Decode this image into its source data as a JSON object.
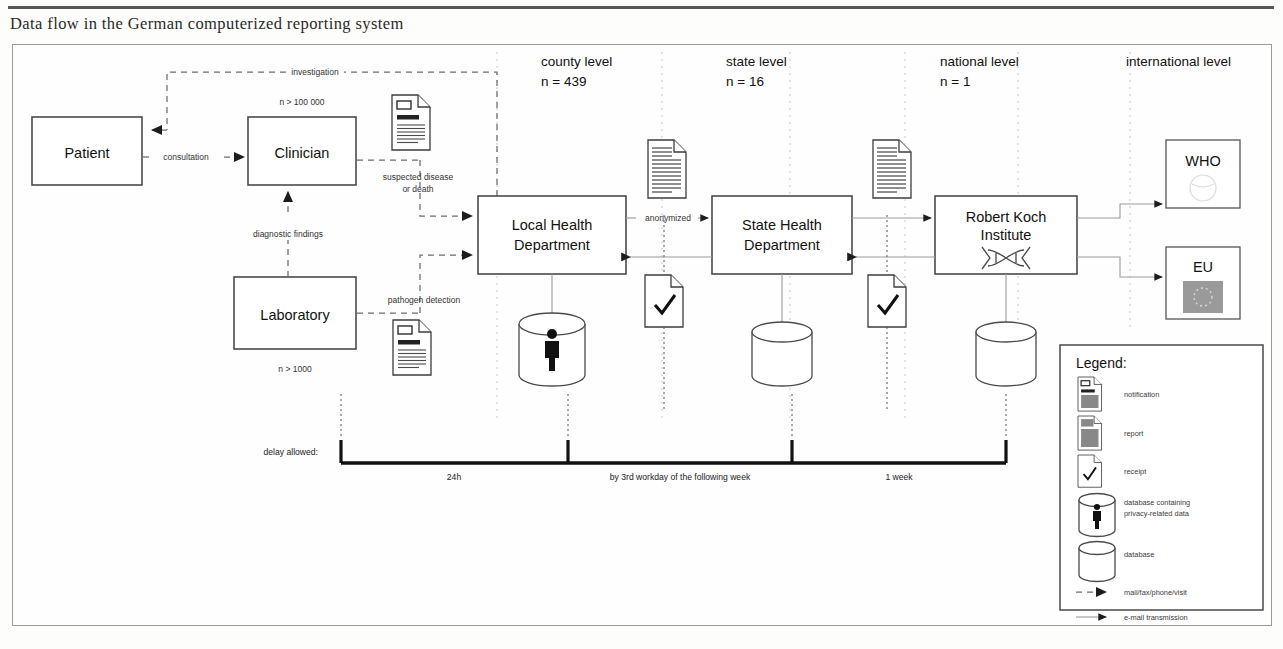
{
  "caption": "Data flow in the German computerized reporting system",
  "columns": [
    {
      "title": "county level",
      "count": "n = 439"
    },
    {
      "title": "state level",
      "count": "n = 16"
    },
    {
      "title": "national level",
      "count": "n = 1"
    },
    {
      "title": "international level",
      "count": ""
    }
  ],
  "nodes": {
    "patient": "Patient",
    "clinician": "Clinician",
    "clinician_count": "n > 100 000",
    "laboratory": "Laboratory",
    "laboratory_count": "n > 1000",
    "local_health_department_line1": "Local Health",
    "local_health_department_line2": "Department",
    "state_health_department_line1": "State Health",
    "state_health_department_line2": "Department",
    "rki_line1": "Robert Koch",
    "rki_line2": "Institute",
    "who": "WHO",
    "eu": "EU"
  },
  "edges": {
    "investigation": "investigation",
    "consultation": "consultation",
    "diagnostic_findings": "diagnostic findings",
    "suspected_line1": "suspected disease",
    "suspected_line2": "or death",
    "pathogen_detection": "pathogen detection",
    "anonymized": "anonymized"
  },
  "timeline": {
    "label": "delay allowed:",
    "segments": [
      "24h",
      "by 3rd workday of the following week",
      "1 week"
    ]
  },
  "legend": {
    "title": "Legend:",
    "items": [
      {
        "icon": "notification-icon",
        "label_line1": "notification",
        "label_line2": ""
      },
      {
        "icon": "report-icon",
        "label_line1": "report",
        "label_line2": ""
      },
      {
        "icon": "receipt-icon",
        "label_line1": "receipt",
        "label_line2": ""
      },
      {
        "icon": "database-privacy-icon",
        "label_line1": "database containing",
        "label_line2": "privacy-related data"
      },
      {
        "icon": "database-icon",
        "label_line1": "database",
        "label_line2": ""
      },
      {
        "icon": "dashed-arrow-icon",
        "label_line1": "mail/fax/phone/visit",
        "label_line2": ""
      },
      {
        "icon": "solid-arrow-icon",
        "label_line1": "e-mail transmission",
        "label_line2": ""
      }
    ]
  },
  "colors": {
    "ink": "#111111",
    "rule": "#3a3a3a",
    "frame": "#9a9a9a",
    "dashed": "#6c6c6c",
    "light": "#9a9a9a"
  }
}
